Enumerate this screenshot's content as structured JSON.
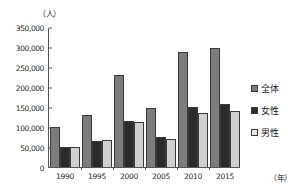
{
  "chart_data": {
    "type": "bar",
    "title": "",
    "xlabel": "（年）",
    "ylabel": "（人）",
    "categories": [
      "1990",
      "1995",
      "2000",
      "2005",
      "2010",
      "2015"
    ],
    "series": [
      {
        "name": "全体",
        "color": "#7c7c7c",
        "values": [
          100000,
          131000,
          230000,
          147000,
          287000,
          297000
        ]
      },
      {
        "name": "女性",
        "color": "#2b2b2b",
        "values": [
          49000,
          64000,
          115000,
          75000,
          151000,
          157000
        ]
      },
      {
        "name": "男性",
        "color": "#cfcfcf",
        "values": [
          50000,
          67000,
          113000,
          69000,
          135000,
          139000
        ]
      }
    ],
    "ylim": [
      0,
      350000
    ],
    "yticks": [
      "0",
      "50,000",
      "100,000",
      "150,000",
      "200,000",
      "250,000",
      "300,000",
      "350,000"
    ],
    "ytick_values": [
      0,
      50000,
      100000,
      150000,
      200000,
      250000,
      300000,
      350000
    ],
    "grid": false,
    "legend_position": "right"
  },
  "axes": {
    "y_unit_label": "（人）",
    "x_unit_label": "（年）"
  },
  "legend": {
    "items": [
      {
        "label": "全体",
        "swatch": "legend-swatch-total"
      },
      {
        "label": "女性",
        "swatch": "legend-swatch-female"
      },
      {
        "label": "男性",
        "swatch": "legend-swatch-male"
      }
    ]
  }
}
